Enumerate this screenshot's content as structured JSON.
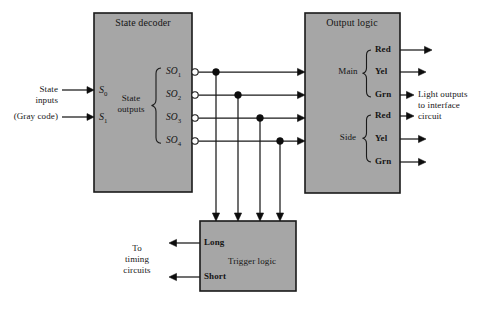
{
  "figure": {
    "type": "block-diagram",
    "background": "#ffffff",
    "block_fill": "#a6a6a6",
    "line_color": "#1a1a1a"
  },
  "blocks": {
    "state_decoder": {
      "title": "State decoder",
      "inner_label_line1": "State",
      "inner_label_line2": "outputs"
    },
    "output_logic": {
      "title": "Output logic",
      "group_main": "Main",
      "group_side": "Side"
    },
    "trigger_logic": {
      "title": "Trigger logic",
      "port_long": "Long",
      "port_short": "Short"
    }
  },
  "inputs": {
    "caption_line1": "State",
    "caption_line2": "inputs",
    "caption_line3": "(Gray code)",
    "pins": [
      {
        "name": "S",
        "subscript": "0"
      },
      {
        "name": "S",
        "subscript": "1"
      }
    ]
  },
  "state_outputs": [
    {
      "name": "SO",
      "subscript": "1"
    },
    {
      "name": "SO",
      "subscript": "2"
    },
    {
      "name": "SO",
      "subscript": "3"
    },
    {
      "name": "SO",
      "subscript": "4"
    }
  ],
  "light_outputs": {
    "main": [
      "Red",
      "Yel",
      "Grn"
    ],
    "side": [
      "Red",
      "Yel",
      "Grn"
    ],
    "caption_line1": "Light outputs",
    "caption_line2": "to interface",
    "caption_line3": "circuit"
  },
  "timing_caption": {
    "line1": "To",
    "line2": "timing",
    "line3": "circuits"
  }
}
